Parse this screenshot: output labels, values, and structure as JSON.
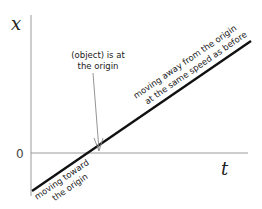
{
  "diagram": {
    "y_axis_label": "x",
    "x_axis_label": "t",
    "origin_label": "0",
    "annotations": {
      "at_origin": [
        "(object) is at",
        "the origin"
      ],
      "moving_away": [
        "moving away from the origin",
        "at the same speed as before"
      ],
      "moving_toward": [
        "moving toward",
        "the origin"
      ]
    },
    "colors": {
      "axis": "#999999",
      "line": "#111111",
      "arrow": "#888888"
    }
  }
}
